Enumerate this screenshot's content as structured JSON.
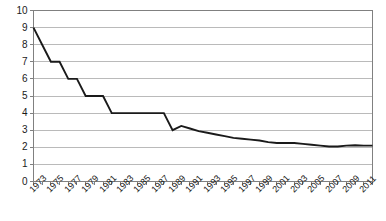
{
  "chart_data": {
    "type": "line",
    "title": "",
    "subtitle": "",
    "xlabel": "",
    "ylabel": "",
    "xlim": [
      1973,
      2012
    ],
    "ylim": [
      0,
      10
    ],
    "grid": true,
    "legend": false,
    "legend_position": "none",
    "y_ticks": [
      0,
      1,
      2,
      3,
      4,
      5,
      6,
      7,
      8,
      9,
      10
    ],
    "y_tick_labels": [
      "0",
      "1",
      "2",
      "3",
      "4",
      "5",
      "6",
      "7",
      "8",
      "9",
      "10"
    ],
    "x_tick_labels": [
      "1973",
      "1975",
      "1977",
      "1979",
      "1981",
      "1983",
      "1985",
      "1987",
      "1989",
      "1991",
      "1993",
      "1995",
      "1997",
      "1999",
      "2001",
      "2003",
      "2005",
      "2007",
      "2009",
      "2011"
    ],
    "x": [
      1973,
      1974,
      1975,
      1976,
      1977,
      1978,
      1979,
      1980,
      1981,
      1982,
      1983,
      1984,
      1985,
      1986,
      1987,
      1988,
      1989,
      1990,
      1991,
      1992,
      1993,
      1994,
      1995,
      1996,
      1997,
      1998,
      1999,
      2000,
      2001,
      2002,
      2003,
      2004,
      2005,
      2006,
      2007,
      2008,
      2009,
      2010,
      2011,
      2012
    ],
    "series": [
      {
        "name": "value",
        "color": "#1a1a1a",
        "values": [
          9,
          8,
          7,
          7,
          6,
          6,
          5,
          5,
          5,
          4,
          4,
          4,
          4,
          4,
          4,
          4,
          3,
          3.25,
          3.1,
          2.95,
          2.85,
          2.75,
          2.65,
          2.55,
          2.5,
          2.45,
          2.4,
          2.3,
          2.25,
          2.25,
          2.25,
          2.2,
          2.15,
          2.1,
          2.05,
          2.05,
          2.1,
          2.12,
          2.1,
          2.1
        ]
      }
    ],
    "colors": {
      "line": "#1a1a1a",
      "gridline": "#b3b3b3",
      "axis": "#808080",
      "background": "#ffffff",
      "text": "#1a1a1a"
    }
  }
}
